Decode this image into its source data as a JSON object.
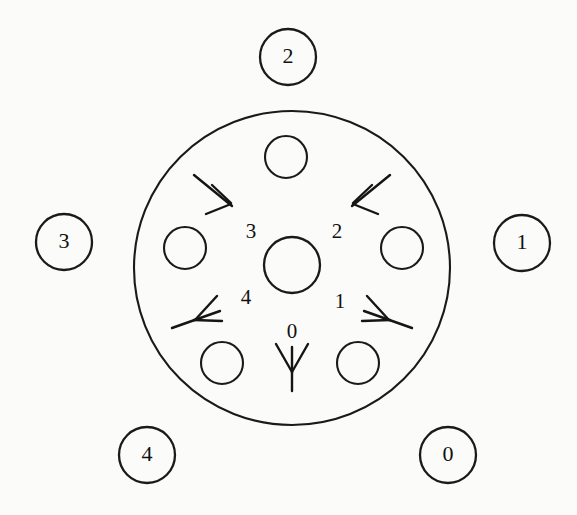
{
  "diagram": {
    "background_color": "#fbfbf9",
    "stroke_color": "#1a1a1a",
    "outer_ring": {
      "center_x": 292,
      "center_y": 268,
      "radius": 157
    },
    "hub": {
      "center_x": 292,
      "center_y": 265,
      "radius": 28
    },
    "inner_ports": [
      {
        "id": "port-top",
        "center_x": 286,
        "center_y": 157,
        "radius": 21
      },
      {
        "id": "port-left",
        "center_x": 185,
        "center_y": 248,
        "radius": 21
      },
      {
        "id": "port-right",
        "center_x": 402,
        "center_y": 248,
        "radius": 21
      },
      {
        "id": "port-bottom-left",
        "center_x": 222,
        "center_y": 363,
        "radius": 21
      },
      {
        "id": "port-bottom-right",
        "center_x": 358,
        "center_y": 363,
        "radius": 21
      }
    ],
    "outer_nodes": [
      {
        "label": "2",
        "center_x": 288,
        "center_y": 57,
        "radius": 28,
        "position": "top"
      },
      {
        "label": "3",
        "center_x": 64,
        "center_y": 242,
        "radius": 28,
        "position": "left"
      },
      {
        "label": "1",
        "center_x": 522,
        "center_y": 243,
        "radius": 28,
        "position": "right"
      },
      {
        "label": "4",
        "center_x": 147,
        "center_y": 455,
        "radius": 28,
        "position": "bottom-left"
      },
      {
        "label": "0",
        "center_x": 448,
        "center_y": 455,
        "radius": 28,
        "position": "bottom-right"
      }
    ],
    "direction_markers": [
      {
        "label": "0",
        "label_x": 292,
        "label_y": 333,
        "angle_deg": 90,
        "tail_x": 292,
        "tail_y": 391,
        "tip_x": 292,
        "tip_y": 348
      },
      {
        "label": "1",
        "label_x": 340,
        "label_y": 303,
        "angle_deg": 36,
        "tail_x": 408,
        "tail_y": 327,
        "tip_x": 363,
        "tip_y": 311
      },
      {
        "label": "2",
        "label_x": 337,
        "label_y": 233,
        "angle_deg": -54,
        "tail_x": 386,
        "tail_y": 177,
        "tip_x": 353,
        "tip_y": 205
      },
      {
        "label": "3",
        "label_x": 251,
        "label_y": 233,
        "angle_deg": -126,
        "tail_x": 197,
        "tail_y": 177,
        "tip_x": 230,
        "tip_y": 205
      },
      {
        "label": "4",
        "label_x": 246,
        "label_y": 299,
        "angle_deg": 144,
        "tail_x": 176,
        "tail_y": 327,
        "tip_x": 221,
        "tip_y": 311
      }
    ]
  }
}
